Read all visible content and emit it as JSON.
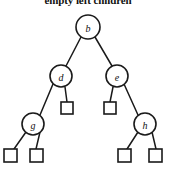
{
  "figure": {
    "caption": "empty left children",
    "background_color": "#ffffff",
    "stroke_color": "#1a1a1a",
    "fill_color": "#ffffff"
  },
  "tree": {
    "type": "binary-tree-diagram",
    "internal_nodes": [
      {
        "id": "b",
        "label": "b",
        "x": 88,
        "y": 27,
        "r": 12
      },
      {
        "id": "d",
        "label": "d",
        "x": 61,
        "y": 76,
        "r": 11
      },
      {
        "id": "e",
        "label": "e",
        "x": 117,
        "y": 76,
        "r": 11
      },
      {
        "id": "g",
        "label": "g",
        "x": 33,
        "y": 124,
        "r": 11
      },
      {
        "id": "h",
        "label": "h",
        "x": 145,
        "y": 124,
        "r": 11
      }
    ],
    "leaf_nodes": [
      {
        "id": "leaf-d-right",
        "x": 67,
        "y": 108,
        "size": 12
      },
      {
        "id": "leaf-e-left",
        "x": 110,
        "y": 108,
        "size": 12
      },
      {
        "id": "leaf-g-left",
        "x": 10,
        "y": 155,
        "size": 13
      },
      {
        "id": "leaf-g-right",
        "x": 37,
        "y": 155,
        "size": 13
      },
      {
        "id": "leaf-h-left",
        "x": 124,
        "y": 155,
        "size": 13
      },
      {
        "id": "leaf-h-right",
        "x": 155,
        "y": 155,
        "size": 13
      }
    ],
    "edges": [
      {
        "from": "b",
        "to": "d"
      },
      {
        "from": "b",
        "to": "e"
      },
      {
        "from": "d",
        "to": "g"
      },
      {
        "from": "d",
        "to": "leaf-d-right"
      },
      {
        "from": "e",
        "to": "leaf-e-left"
      },
      {
        "from": "e",
        "to": "h"
      },
      {
        "from": "g",
        "to": "leaf-g-left"
      },
      {
        "from": "g",
        "to": "leaf-g-right"
      },
      {
        "from": "h",
        "to": "leaf-h-left"
      },
      {
        "from": "h",
        "to": "leaf-h-right"
      }
    ]
  }
}
